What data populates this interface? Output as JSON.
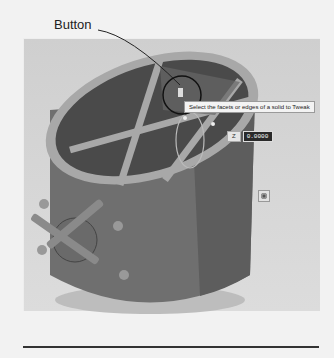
{
  "callout": {
    "label": "Button"
  },
  "viewport": {
    "tooltip": "Select the facets or edges of a solid to Tweak",
    "dimension": {
      "label": "Z",
      "value": "0.0000"
    },
    "model": "cylinder-with-cross-braced-rim",
    "colors": {
      "background": "#d3d3d3",
      "body": "#6e6e6e",
      "rim": "#a9a9a9",
      "callout_circle": "#111111"
    }
  }
}
